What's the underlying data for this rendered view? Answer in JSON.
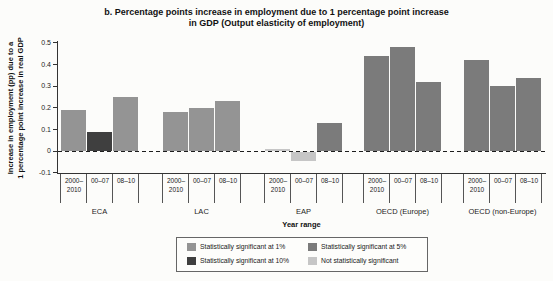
{
  "title": {
    "line1": "b. Percentage points increase in employment due to 1 percentage point increase",
    "line2": "in GDP (Output elasticity of employment)"
  },
  "y_axis": {
    "label_line1": "Increase in employment (pp) due to a",
    "label_line2": "1 percentage point increase in real GDP",
    "ticks": [
      "0.5",
      "0.4",
      "0.3",
      "0.2",
      "0.1",
      "0",
      "-0.1"
    ]
  },
  "x_axis": {
    "title": "Year range"
  },
  "legend": {
    "items": [
      {
        "label": "Statistically significant at 1%",
        "color": "#949494"
      },
      {
        "label": "Statistically significant at 5%",
        "color": "#7b7b7b"
      },
      {
        "label": "Statistically significant at 10%",
        "color": "#3f3f3f"
      },
      {
        "label": "Not statistically significant",
        "color": "#c6c6c6"
      }
    ]
  },
  "chart_data": {
    "type": "bar",
    "title": "b. Percentage points increase in employment due to 1 percentage point increase in GDP (Output elasticity of employment)",
    "xlabel": "Year range",
    "ylabel": "Increase in employment (pp) due to a 1 percentage point increase in real GDP",
    "ylim": [
      -0.1,
      0.5
    ],
    "ytick_step": 0.1,
    "grid": false,
    "legend_position": "bottom",
    "significance_colors": {
      "1%": "#949494",
      "5%": "#7b7b7b",
      "10%": "#3f3f3f",
      "ns": "#c6c6c6"
    },
    "groups": [
      {
        "label": "ECA",
        "bars": [
          {
            "period": "2000–2010",
            "value": 0.19,
            "significance": "1%"
          },
          {
            "period": "00–07",
            "value": 0.09,
            "significance": "10%"
          },
          {
            "period": "08–10",
            "value": 0.25,
            "significance": "1%"
          }
        ]
      },
      {
        "label": "LAC",
        "bars": [
          {
            "period": "2000–2010",
            "value": 0.18,
            "significance": "1%"
          },
          {
            "period": "00–07",
            "value": 0.2,
            "significance": "1%"
          },
          {
            "period": "08–10",
            "value": 0.23,
            "significance": "1%"
          }
        ]
      },
      {
        "label": "EAP",
        "bars": [
          {
            "period": "2000–2010",
            "value": 0.01,
            "significance": "ns"
          },
          {
            "period": "00–07",
            "value": -0.04,
            "significance": "ns"
          },
          {
            "period": "08–10",
            "value": 0.13,
            "significance": "5%"
          }
        ]
      },
      {
        "label": "OECD (Europe)",
        "bars": [
          {
            "period": "2000–2010",
            "value": 0.44,
            "significance": "5%"
          },
          {
            "period": "00–07",
            "value": 0.48,
            "significance": "5%"
          },
          {
            "period": "08–10",
            "value": 0.32,
            "significance": "5%"
          }
        ]
      },
      {
        "label": "OECD (non-Europe)",
        "bars": [
          {
            "period": "2000–2010",
            "value": 0.42,
            "significance": "5%"
          },
          {
            "period": "00–07",
            "value": 0.3,
            "significance": "5%"
          },
          {
            "period": "08–10",
            "value": 0.34,
            "significance": "5%"
          }
        ]
      }
    ]
  }
}
